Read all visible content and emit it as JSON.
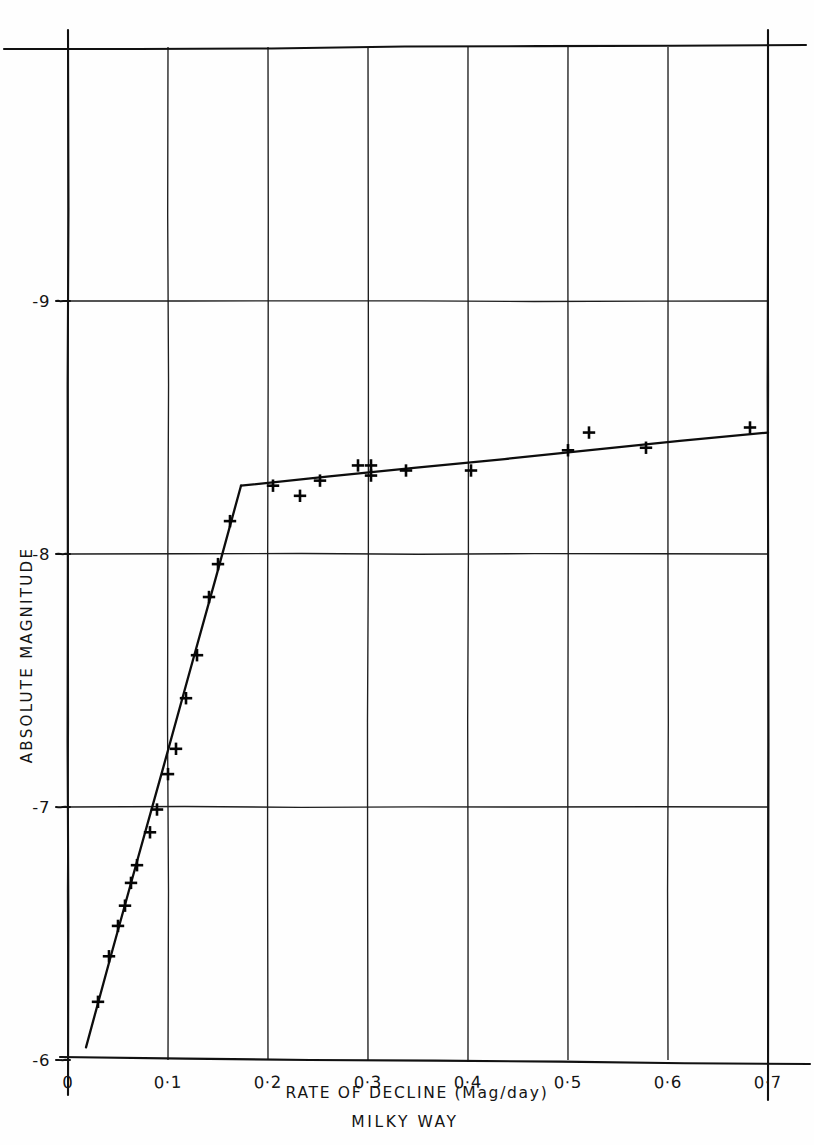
{
  "figure": {
    "name": "absolute-magnitude-vs-rate-of-decline",
    "background_color": "#fefefe",
    "ink_color": "#111111"
  },
  "chart_data": {
    "type": "scatter",
    "title": "",
    "subtitle": "MILKY WAY",
    "xlabel": "RATE OF DECLINE (Mag/day)",
    "ylabel": "ABSOLUTE MAGNITUDE",
    "xlim": [
      0,
      0.7
    ],
    "ylim": [
      -6,
      -9.4
    ],
    "y_axis_inverted": true,
    "grid": true,
    "legend": false,
    "legend_position": "none",
    "xticks": [
      0,
      0.1,
      0.2,
      0.3,
      0.4,
      0.5,
      0.6,
      0.7
    ],
    "xtick_labels": [
      "0",
      "0·1",
      "0·2",
      "0·3",
      "0·4",
      "0·5",
      "0·6",
      "0·7"
    ],
    "yticks": [
      -6,
      -7,
      -8,
      -9
    ],
    "ytick_labels": [
      "-6",
      "-7",
      "-8",
      "-9"
    ],
    "marker_style": "plus",
    "points": [
      {
        "x": 0.03,
        "y": -6.23
      },
      {
        "x": 0.041,
        "y": -6.41
      },
      {
        "x": 0.05,
        "y": -6.53
      },
      {
        "x": 0.057,
        "y": -6.61
      },
      {
        "x": 0.063,
        "y": -6.7
      },
      {
        "x": 0.069,
        "y": -6.77
      },
      {
        "x": 0.082,
        "y": -6.9
      },
      {
        "x": 0.089,
        "y": -6.99
      },
      {
        "x": 0.1,
        "y": -7.13
      },
      {
        "x": 0.108,
        "y": -7.23
      },
      {
        "x": 0.118,
        "y": -7.43
      },
      {
        "x": 0.129,
        "y": -7.6
      },
      {
        "x": 0.141,
        "y": -7.83
      },
      {
        "x": 0.15,
        "y": -7.96
      },
      {
        "x": 0.162,
        "y": -8.13
      },
      {
        "x": 0.205,
        "y": -8.27
      },
      {
        "x": 0.232,
        "y": -8.23
      },
      {
        "x": 0.252,
        "y": -8.29
      },
      {
        "x": 0.29,
        "y": -8.35
      },
      {
        "x": 0.303,
        "y": -8.35
      },
      {
        "x": 0.303,
        "y": -8.31
      },
      {
        "x": 0.338,
        "y": -8.33
      },
      {
        "x": 0.403,
        "y": -8.33
      },
      {
        "x": 0.5,
        "y": -8.41
      },
      {
        "x": 0.521,
        "y": -8.48
      },
      {
        "x": 0.578,
        "y": -8.42
      },
      {
        "x": 0.682,
        "y": -8.5
      }
    ],
    "fit_line": {
      "description": "two-branch broken line fit",
      "break_point": {
        "x": 0.173,
        "y": -8.27
      },
      "segments": [
        {
          "name": "steep-branch",
          "from": {
            "x": 0.018,
            "y": -6.05
          },
          "to": {
            "x": 0.173,
            "y": -8.27
          }
        },
        {
          "name": "shallow-branch",
          "from": {
            "x": 0.173,
            "y": -8.27
          },
          "to": {
            "x": 0.7,
            "y": -8.48
          }
        }
      ]
    }
  }
}
